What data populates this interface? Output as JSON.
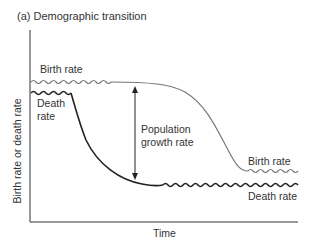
{
  "figure": {
    "title": "(a) Demographic transition",
    "y_axis_label": "Birth rate or death rate",
    "x_axis_label": "Time",
    "labels": {
      "birth_rate_start": "Birth rate",
      "death_rate_start_line1": "Death",
      "death_rate_start_line2": "rate",
      "growth_line1": "Population",
      "growth_line2": "growth rate",
      "birth_rate_end": "Birth rate",
      "death_rate_end": "Death rate"
    },
    "colors": {
      "birth_curve": "#777777",
      "death_curve": "#222222",
      "axis": "#333333"
    }
  }
}
